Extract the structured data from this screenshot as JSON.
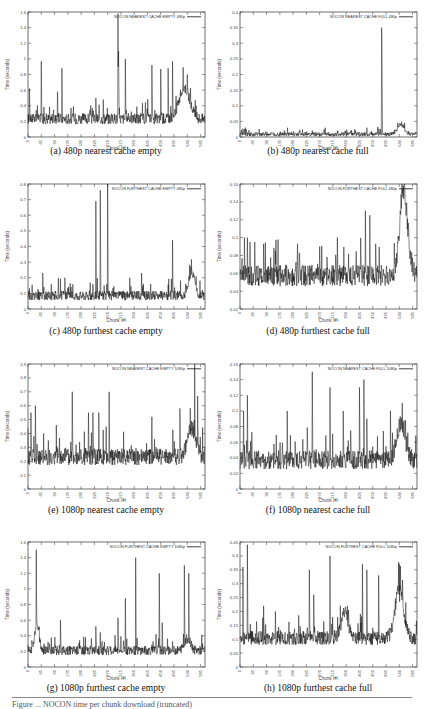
{
  "figure": {
    "footer_partial": "Figure ... NOCON time per chunk download (truncated)"
  },
  "chart_data": [
    {
      "id": "a",
      "type": "line",
      "caption": "(a) 480p nearest cache empty",
      "legend": "NOCON NEAREST CACHE EMPTY 480p",
      "xlabel": "Chunk (#)",
      "ylabel": "Time (seconds)",
      "xlim": [
        0,
        600
      ],
      "ylim": [
        0,
        1.6
      ],
      "xticks": [
        0,
        45,
        90,
        135,
        180,
        225,
        270,
        315,
        360,
        405,
        450,
        495,
        540,
        585
      ],
      "yticks": [
        0,
        0.2,
        0.4,
        0.6,
        0.8,
        1,
        1.2,
        1.4,
        1.6
      ],
      "ytick_labels": [
        "0",
        "0.2",
        "0.4",
        "0.6",
        "0.8",
        "1",
        "1.2",
        "1.4",
        "1.6"
      ],
      "grid": false,
      "legend_position": "top-right",
      "baseline": 0.22,
      "noise": 0.07,
      "spikes": [
        [
          5,
          0.62
        ],
        [
          45,
          0.97
        ],
        [
          100,
          0.58
        ],
        [
          115,
          0.88
        ],
        [
          230,
          0.5
        ],
        [
          255,
          0.48
        ],
        [
          305,
          1.58
        ],
        [
          307,
          1.1
        ],
        [
          330,
          1.0
        ],
        [
          420,
          0.92
        ],
        [
          450,
          0.87
        ],
        [
          475,
          0.88
        ],
        [
          490,
          0.97
        ]
      ],
      "bumps": [
        [
          530,
          25,
          0.4
        ]
      ]
    },
    {
      "id": "b",
      "type": "line",
      "caption": "(b) 480p nearest cache full",
      "legend": "NOCON NEAREST CACHE FULL 480p",
      "xlabel": "Chunk (#)",
      "ylabel": "Time (seconds)",
      "xlim": [
        0,
        600
      ],
      "ylim": [
        0,
        0.4
      ],
      "xticks": [
        0,
        45,
        90,
        135,
        180,
        225,
        270,
        315,
        360,
        405,
        450,
        495,
        540,
        585
      ],
      "yticks": [
        0,
        0.05,
        0.1,
        0.15,
        0.2,
        0.25,
        0.3,
        0.35,
        0.4
      ],
      "ytick_labels": [
        "0",
        "0.05",
        "0.1",
        "0.15",
        "0.2",
        "0.25",
        "0.3",
        "0.35",
        "0.4"
      ],
      "grid": false,
      "legend_position": "top-right",
      "baseline": 0.008,
      "noise": 0.006,
      "spikes": [
        [
          15,
          0.025
        ],
        [
          30,
          0.022
        ],
        [
          80,
          0.015
        ],
        [
          200,
          0.017
        ],
        [
          330,
          0.02
        ],
        [
          430,
          0.03
        ],
        [
          480,
          0.35
        ],
        [
          481,
          0.32
        ]
      ],
      "bumps": [
        [
          545,
          15,
          0.03
        ]
      ]
    },
    {
      "id": "c",
      "type": "line",
      "caption": "(c) 480p furthest cache empty",
      "legend": "NOCON FURTHEST CACHE EMPTY 480p",
      "xlabel": "Chunk (#)",
      "ylabel": "Time (seconds)",
      "xlim": [
        0,
        600
      ],
      "ylim": [
        0,
        0.8
      ],
      "xticks": [
        0,
        45,
        90,
        135,
        180,
        225,
        270,
        315,
        360,
        405,
        450,
        495,
        540,
        585
      ],
      "yticks": [
        0,
        0.1,
        0.2,
        0.3,
        0.4,
        0.5,
        0.6,
        0.7,
        0.8
      ],
      "ytick_labels": [
        "0",
        "0.1",
        "0.2",
        "0.3",
        "0.4",
        "0.5",
        "0.6",
        "0.7",
        "0.8"
      ],
      "grid": false,
      "legend_position": "top-right",
      "baseline": 0.08,
      "noise": 0.03,
      "spikes": [
        [
          50,
          0.23
        ],
        [
          125,
          0.2
        ],
        [
          230,
          0.69
        ],
        [
          245,
          0.76
        ],
        [
          270,
          0.8
        ],
        [
          345,
          0.2
        ],
        [
          385,
          0.23
        ],
        [
          490,
          0.44
        ]
      ],
      "bumps": [
        [
          555,
          15,
          0.15
        ]
      ]
    },
    {
      "id": "d",
      "type": "line",
      "caption": "(d) 480p furthest cache full",
      "legend": "NOCON FURTHEST CACHE FULL 480p",
      "xlabel": "Chunk (#)",
      "ylabel": "Time (seconds)",
      "xlim": [
        0,
        600
      ],
      "ylim": [
        0.02,
        0.16
      ],
      "xticks": [
        0,
        45,
        90,
        135,
        180,
        225,
        270,
        315,
        360,
        405,
        450,
        495,
        540,
        585
      ],
      "yticks": [
        0.02,
        0.04,
        0.06,
        0.08,
        0.1,
        0.12,
        0.14,
        0.16
      ],
      "ytick_labels": [
        "0.02",
        "0.04",
        "0.06",
        "0.08",
        "0.1",
        "0.12",
        "0.14",
        "0.16"
      ],
      "grid": false,
      "legend_position": "top-right",
      "baseline": 0.055,
      "noise": 0.012,
      "spikes": [
        [
          15,
          0.1
        ],
        [
          25,
          0.1
        ],
        [
          50,
          0.095
        ],
        [
          80,
          0.093
        ],
        [
          120,
          0.085
        ],
        [
          195,
          0.093
        ],
        [
          270,
          0.09
        ],
        [
          330,
          0.1
        ],
        [
          425,
          0.13
        ],
        [
          440,
          0.125
        ],
        [
          460,
          0.093
        ]
      ],
      "bumps": [
        [
          555,
          20,
          0.09
        ]
      ]
    },
    {
      "id": "e",
      "type": "line",
      "caption": "(e) 1080p nearest cache empty",
      "legend": "NOCON NEAREST CACHE EMPTY 1080p",
      "xlabel": "Chunk (#)",
      "ylabel": "Time (seconds)",
      "xlim": [
        0,
        600
      ],
      "ylim": [
        0,
        0.9
      ],
      "xticks": [
        0,
        45,
        90,
        135,
        180,
        225,
        270,
        315,
        360,
        405,
        450,
        495,
        540,
        585
      ],
      "yticks": [
        0,
        0.1,
        0.2,
        0.3,
        0.4,
        0.5,
        0.6,
        0.7,
        0.8,
        0.9
      ],
      "ytick_labels": [
        "0",
        "0.1",
        "0.2",
        "0.3",
        "0.4",
        "0.5",
        "0.6",
        "0.7",
        "0.8",
        "0.9"
      ],
      "grid": false,
      "legend_position": "top-right",
      "baseline": 0.22,
      "noise": 0.06,
      "spikes": [
        [
          10,
          0.55
        ],
        [
          25,
          0.6
        ],
        [
          150,
          0.7
        ],
        [
          205,
          0.55
        ],
        [
          220,
          0.55
        ],
        [
          240,
          0.55
        ],
        [
          275,
          0.7
        ],
        [
          420,
          0.52
        ],
        [
          515,
          0.58
        ],
        [
          565,
          0.9
        ],
        [
          575,
          0.67
        ]
      ],
      "bumps": [
        [
          555,
          20,
          0.2
        ]
      ]
    },
    {
      "id": "f",
      "type": "line",
      "caption": "(f) 1080p nearest cache full",
      "legend": "NOCON NEAREST CACHE FULL 1080p",
      "xlabel": "Chunk (#)",
      "ylabel": "Time (seconds)",
      "xlim": [
        0,
        600
      ],
      "ylim": [
        0,
        0.16
      ],
      "xticks": [
        0,
        45,
        90,
        135,
        180,
        225,
        270,
        315,
        360,
        405,
        450,
        495,
        540,
        585
      ],
      "yticks": [
        0,
        0.02,
        0.04,
        0.06,
        0.08,
        0.1,
        0.12,
        0.14,
        0.16
      ],
      "ytick_labels": [
        "0",
        "0.02",
        "0.04",
        "0.06",
        "0.08",
        "0.1",
        "0.12",
        "0.14",
        "0.16"
      ],
      "grid": false,
      "legend_position": "top-right",
      "baseline": 0.035,
      "noise": 0.012,
      "spikes": [
        [
          12,
          0.1
        ],
        [
          25,
          0.12
        ],
        [
          160,
          0.1
        ],
        [
          245,
          0.15
        ],
        [
          305,
          0.13
        ],
        [
          350,
          0.1
        ],
        [
          405,
          0.13
        ],
        [
          420,
          0.14
        ],
        [
          430,
          0.09
        ],
        [
          510,
          0.1
        ],
        [
          550,
          0.11
        ]
      ],
      "bumps": [
        [
          545,
          20,
          0.045
        ]
      ]
    },
    {
      "id": "g",
      "type": "line",
      "caption": "(g) 1080p furthest cache empty",
      "legend": "NOCON FURTHEST CACHE EMPTY 1080p",
      "xlabel": "Chunk (#)",
      "ylabel": "Time (seconds)",
      "xlim": [
        0,
        600
      ],
      "ylim": [
        0,
        1.6
      ],
      "xticks": [
        0,
        45,
        90,
        135,
        180,
        225,
        270,
        315,
        360,
        405,
        450,
        495,
        540,
        585
      ],
      "yticks": [
        0,
        0.2,
        0.4,
        0.6,
        0.8,
        1,
        1.2,
        1.4,
        1.6
      ],
      "ytick_labels": [
        "0",
        "0.2",
        "0.4",
        "0.6",
        "0.8",
        "1",
        "1.2",
        "1.4",
        "1.6"
      ],
      "grid": false,
      "legend_position": "top-right",
      "baseline": 0.2,
      "noise": 0.06,
      "spikes": [
        [
          28,
          1.5
        ],
        [
          110,
          0.6
        ],
        [
          230,
          0.52
        ],
        [
          305,
          0.63
        ],
        [
          330,
          0.88
        ],
        [
          365,
          1.4
        ],
        [
          445,
          1.2
        ],
        [
          455,
          0.57
        ],
        [
          530,
          1.3
        ],
        [
          545,
          1.2
        ]
      ],
      "bumps": [
        [
          30,
          10,
          0.35
        ],
        [
          540,
          15,
          0.15
        ]
      ]
    },
    {
      "id": "h",
      "type": "line",
      "caption": "(h) 1080p furthest cache full",
      "legend": "NOCON FURTHEST CACHE FULL 1080p",
      "xlabel": "Chunk (#)",
      "ylabel": "Time (seconds)",
      "xlim": [
        0,
        600
      ],
      "ylim": [
        0,
        0.45
      ],
      "xticks": [
        0,
        45,
        90,
        135,
        180,
        225,
        270,
        315,
        360,
        405,
        450,
        495,
        540,
        585
      ],
      "yticks": [
        0,
        0.05,
        0.1,
        0.15,
        0.2,
        0.25,
        0.3,
        0.35,
        0.4,
        0.45
      ],
      "ytick_labels": [
        "0",
        "0.05",
        "0.1",
        "0.15",
        "0.2",
        "0.25",
        "0.3",
        "0.35",
        "0.4",
        "0.45"
      ],
      "grid": false,
      "legend_position": "top-right",
      "baseline": 0.1,
      "noise": 0.025,
      "spikes": [
        [
          10,
          0.36
        ],
        [
          25,
          0.44
        ],
        [
          80,
          0.22
        ],
        [
          120,
          0.2
        ],
        [
          235,
          0.35
        ],
        [
          250,
          0.26
        ],
        [
          305,
          0.4
        ],
        [
          340,
          0.22
        ],
        [
          415,
          0.37
        ],
        [
          430,
          0.35
        ],
        [
          470,
          0.33
        ],
        [
          540,
          0.37
        ]
      ],
      "bumps": [
        [
          355,
          15,
          0.1
        ],
        [
          540,
          20,
          0.18
        ]
      ]
    }
  ]
}
